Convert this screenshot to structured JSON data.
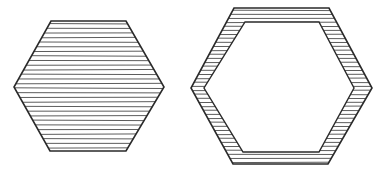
{
  "figure": {
    "width": 390,
    "height": 173,
    "background": "#ffffff",
    "ink_color": "#2a2a2a",
    "hatch_color": "#4a4a4a",
    "shapes": [
      {
        "id": "solid-hexagon",
        "description": "Hexagon fully filled with horizontal hatching",
        "outer": [
          [
            51,
            21
          ],
          [
            126,
            21
          ],
          [
            164,
            87
          ],
          [
            126,
            151
          ],
          [
            50,
            151
          ],
          [
            14,
            87
          ]
        ],
        "hatch_spacing": 4.6
      },
      {
        "id": "hollow-hexagon",
        "description": "Hexagonal ring with hatched border and empty interior",
        "outer": [
          [
            234,
            8
          ],
          [
            329,
            8
          ],
          [
            372,
            88
          ],
          [
            328,
            164
          ],
          [
            233,
            164
          ],
          [
            191,
            88
          ]
        ],
        "inner": [
          [
            245,
            22
          ],
          [
            319,
            22
          ],
          [
            354,
            88
          ],
          [
            319,
            152
          ],
          [
            243,
            152
          ],
          [
            204,
            88
          ]
        ],
        "hatch_spacing": 4.0
      }
    ]
  }
}
